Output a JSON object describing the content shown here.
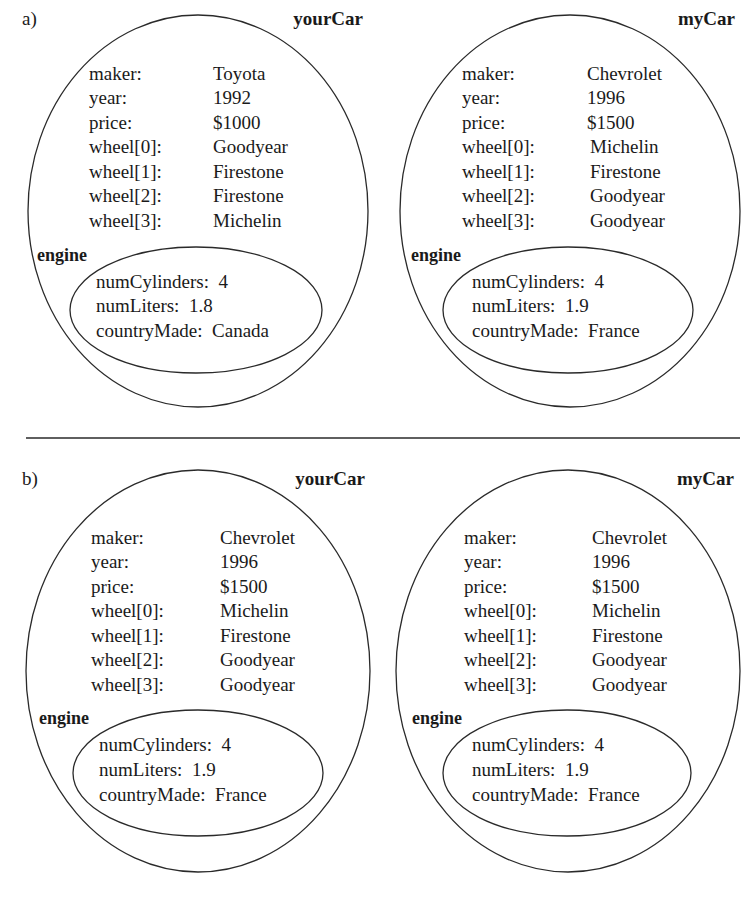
{
  "panels": [
    {
      "label": "a)",
      "objects": [
        {
          "name": "yourCar",
          "fields": [
            {
              "key": "maker:",
              "value": "Toyota"
            },
            {
              "key": "year:",
              "value": "1992"
            },
            {
              "key": "price:",
              "value": "$1000"
            },
            {
              "key": "wheel[0]:",
              "value": "Goodyear"
            },
            {
              "key": "wheel[1]:",
              "value": "Firestone"
            },
            {
              "key": "wheel[2]:",
              "value": "Firestone"
            },
            {
              "key": "wheel[3]:",
              "value": "Michelin"
            }
          ],
          "engine": {
            "label": "engine",
            "fields": [
              {
                "text": "numCylinders:  4"
              },
              {
                "text": "numLiters:  1.8"
              },
              {
                "text": "countryMade:  Canada"
              }
            ]
          }
        },
        {
          "name": "myCar",
          "fields": [
            {
              "key": "maker:",
              "value": "Chevrolet"
            },
            {
              "key": "year:",
              "value": "1996"
            },
            {
              "key": "price:",
              "value": "$1500"
            },
            {
              "key": "wheel[0]:",
              "value": "Michelin"
            },
            {
              "key": "wheel[1]:",
              "value": "Firestone"
            },
            {
              "key": "wheel[2]:",
              "value": "Goodyear"
            },
            {
              "key": "wheel[3]:",
              "value": "Goodyear"
            }
          ],
          "engine": {
            "label": "engine",
            "fields": [
              {
                "text": "numCylinders:  4"
              },
              {
                "text": "numLiters:  1.9"
              },
              {
                "text": "countryMade:  France"
              }
            ]
          }
        }
      ]
    },
    {
      "label": "b)",
      "objects": [
        {
          "name": "yourCar",
          "fields": [
            {
              "key": "maker:",
              "value": "Chevrolet"
            },
            {
              "key": "year:",
              "value": "1996"
            },
            {
              "key": "price:",
              "value": "$1500"
            },
            {
              "key": "wheel[0]:",
              "value": "Michelin"
            },
            {
              "key": "wheel[1]:",
              "value": "Firestone"
            },
            {
              "key": "wheel[2]:",
              "value": "Goodyear"
            },
            {
              "key": "wheel[3]:",
              "value": "Goodyear"
            }
          ],
          "engine": {
            "label": "engine",
            "fields": [
              {
                "text": "numCylinders:  4"
              },
              {
                "text": "numLiters:  1.9"
              },
              {
                "text": "countryMade:  France"
              }
            ]
          }
        },
        {
          "name": "myCar",
          "fields": [
            {
              "key": "maker:",
              "value": "Chevrolet"
            },
            {
              "key": "year:",
              "value": "1996"
            },
            {
              "key": "price:",
              "value": "$1500"
            },
            {
              "key": "wheel[0]:",
              "value": "Michelin"
            },
            {
              "key": "wheel[1]:",
              "value": "Firestone"
            },
            {
              "key": "wheel[2]:",
              "value": "Goodyear"
            },
            {
              "key": "wheel[3]:",
              "value": "Goodyear"
            }
          ],
          "engine": {
            "label": "engine",
            "fields": [
              {
                "text": "numCylinders:  4"
              },
              {
                "text": "numLiters:  1.9"
              },
              {
                "text": "countryMade:  France"
              }
            ]
          }
        }
      ]
    }
  ],
  "colors": {
    "ink": "#1a1a1a",
    "stroke": "#2a2a2a",
    "background": "#ffffff"
  }
}
